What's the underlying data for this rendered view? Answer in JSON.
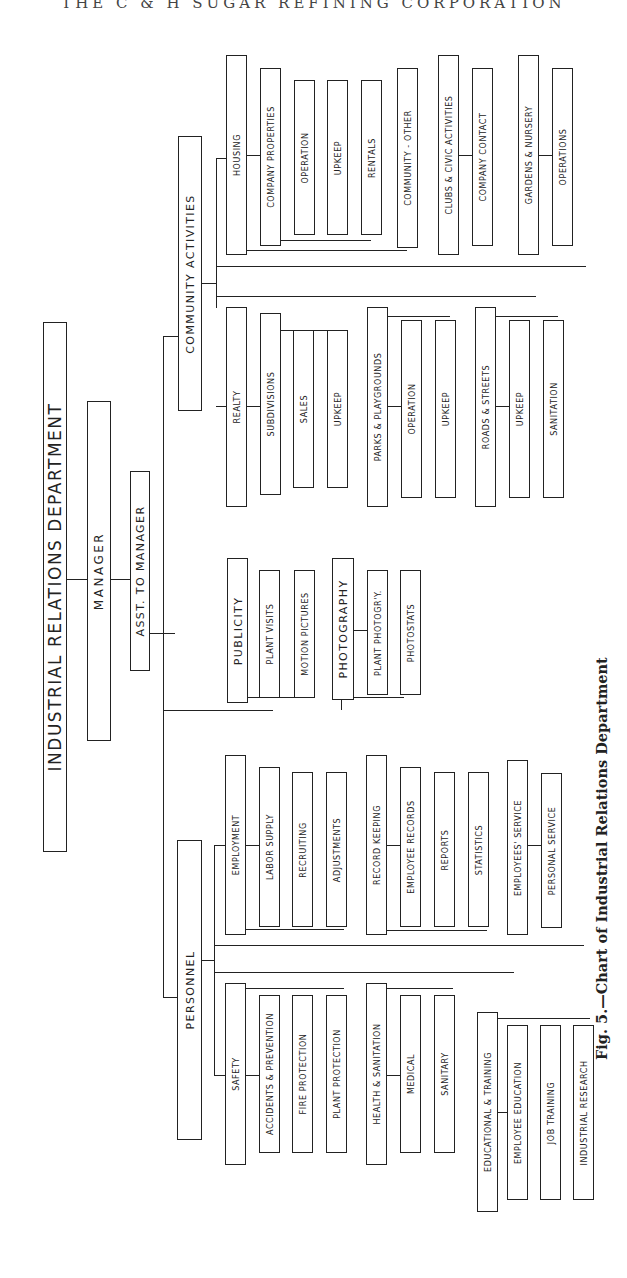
{
  "page_header": "THE C & H SUGAR REFINING CORPORATION",
  "chart": {
    "title": "INDUSTRIAL RELATIONS DEPARTMENT",
    "manager": "MANAGER",
    "assistant": "ASST. TO MANAGER",
    "divisions": {
      "personnel": {
        "label": "PERSONNEL",
        "groups": [
          {
            "label": "SAFETY",
            "items": [
              "ACCIDENTS & PREVENTION",
              "FIRE PROTECTION",
              "PLANT PROTECTION"
            ]
          },
          {
            "label": "HEALTH & SANITATION",
            "items": [
              "MEDICAL",
              "SANITARY"
            ]
          },
          {
            "label": "EDUCATIONAL & TRAINING",
            "items": [
              "EMPLOYEE EDUCATION",
              "JOB TRAINING",
              "INDUSTRIAL RESEARCH"
            ]
          },
          {
            "label": "EMPLOYMENT",
            "items": [
              "LABOR SUPPLY",
              "RECRUITING",
              "ADJUSTMENTS"
            ]
          },
          {
            "label": "RECORD KEEPING",
            "items": [
              "EMPLOYEE RECORDS",
              "REPORTS",
              "STATISTICS"
            ]
          },
          {
            "label": "EMPLOYEES' SERVICE",
            "items": [
              "PERSONAL SERVICE"
            ]
          }
        ]
      },
      "publicity": {
        "label": "PUBLICITY",
        "items": [
          "PLANT VISITS",
          "MOTION PICTURES"
        ],
        "photography": {
          "label": "PHOTOGRAPHY",
          "items": [
            "PLANT PHOTOGR'Y.",
            "PHOTOSTATS"
          ]
        }
      },
      "community": {
        "label": "COMMUNITY ACTIVITIES",
        "groups": [
          {
            "label": "REALTY",
            "items": [
              "SUBDIVISIONS"
            ],
            "sub": [
              "SALES",
              "UPKEEP"
            ]
          },
          {
            "label": "PARKS & PLAYGROUNDS",
            "items": [
              "OPERATION",
              "UPKEEP"
            ]
          },
          {
            "label": "ROADS & STREETS",
            "items": [
              "UPKEEP",
              "SANITATION"
            ]
          },
          {
            "label": "HOUSING",
            "items": [
              "COMPANY PROPERTIES"
            ],
            "sub": [
              "OPERATION",
              "UPKEEP",
              "RENTALS"
            ],
            "other": "COMMUNITY - OTHER"
          },
          {
            "label": "CLUBS & CIVIC ACTIVITIES",
            "items": [
              "COMPANY CONTACT"
            ]
          },
          {
            "label": "GARDENS & NURSERY",
            "items": [
              "OPERATIONS"
            ]
          }
        ]
      }
    }
  },
  "caption": "Fig. 5.—Chart of Industrial Relations Department"
}
